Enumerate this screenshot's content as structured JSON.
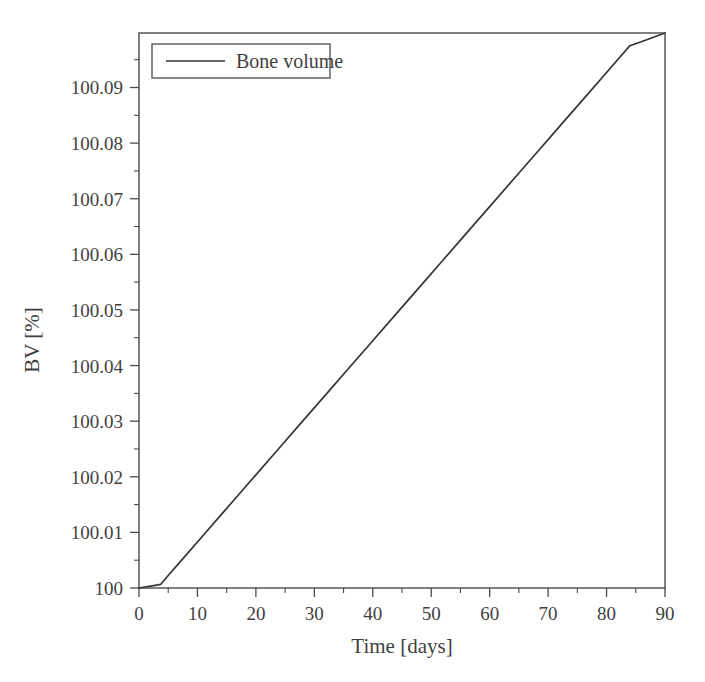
{
  "chart_data": {
    "type": "line",
    "title": "",
    "xlabel": "Time [days]",
    "ylabel": "BV [%]",
    "xlim": [
      0,
      90
    ],
    "ylim": [
      100,
      100.0998
    ],
    "xticks": [
      0,
      10,
      20,
      30,
      40,
      50,
      60,
      70,
      80,
      90
    ],
    "xtick_labels": [
      "0",
      "10",
      "20",
      "30",
      "40",
      "50",
      "60",
      "70",
      "80",
      "90"
    ],
    "xminor_step": 5,
    "yticks": [
      100,
      100.01,
      100.02,
      100.03,
      100.04,
      100.05,
      100.06,
      100.07,
      100.08,
      100.09
    ],
    "ytick_labels": [
      "100",
      "100.01",
      "100.02",
      "100.03",
      "100.04",
      "100.05",
      "100.06",
      "100.07",
      "100.08",
      "100.09"
    ],
    "yminor_step": 0.005,
    "grid": false,
    "legend_position": "upper left",
    "legend": [
      "Bone volume"
    ],
    "line_color": "#353535",
    "axis_color": "#4a4a4a",
    "background_color": "#ffffff",
    "series": [
      {
        "name": "Bone volume",
        "x": [
          0,
          1,
          2,
          3,
          3.7,
          5,
          8,
          11,
          14,
          17,
          20,
          24,
          28,
          32,
          36,
          40,
          44,
          48,
          52,
          56,
          60,
          64,
          68,
          72,
          76,
          80,
          84,
          87,
          90
        ],
        "y": [
          100.0,
          100.00018,
          100.00035,
          100.00052,
          100.00064,
          100.00225,
          100.00587,
          100.00949,
          100.01311,
          100.01673,
          100.02035,
          100.02517,
          100.03,
          100.03482,
          100.03964,
          100.04447,
          100.04929,
          100.05411,
          100.05893,
          100.06376,
          100.06858,
          100.0734,
          100.07823,
          100.08305,
          100.08787,
          100.09269,
          100.09752,
          100.09864,
          100.0998
        ]
      }
    ],
    "annotations": [
      {
        "text": "kink in slope near day 3.7",
        "x": 3.7,
        "y": 100.00064
      }
    ]
  },
  "legend": {
    "entry_label": "Bone volume"
  },
  "axes": {
    "x_title": "Time [days]",
    "y_title": "BV [%]",
    "x_labels": [
      "0",
      "10",
      "20",
      "30",
      "40",
      "50",
      "60",
      "70",
      "80",
      "90"
    ],
    "y_labels": [
      "100",
      "100.01",
      "100.02",
      "100.03",
      "100.04",
      "100.05",
      "100.06",
      "100.07",
      "100.08",
      "100.09"
    ]
  }
}
